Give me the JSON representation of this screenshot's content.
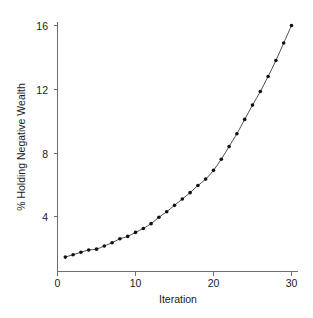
{
  "chart_data": {
    "type": "line",
    "title": "",
    "xlabel": "Iteration",
    "ylabel": "% Holding Negative Wealth",
    "xlim": [
      0,
      31
    ],
    "ylim": [
      0.8,
      16.6
    ],
    "xticks": [
      0,
      10,
      20,
      30
    ],
    "xtick_labels": [
      "0",
      "10",
      "20",
      "30"
    ],
    "yticks": [
      4,
      8,
      12,
      16
    ],
    "ytick_labels": [
      "4",
      "8",
      "12",
      "16"
    ],
    "grid": false,
    "legend": null,
    "marker": "filled-circle",
    "line_color": "#3a3a3a",
    "marker_color": "#111111",
    "axis_color": "#6e6e6e",
    "background_color": "#ffffff",
    "x": [
      1,
      2,
      3,
      4,
      5,
      6,
      7,
      8,
      9,
      10,
      11,
      12,
      13,
      14,
      15,
      16,
      17,
      18,
      19,
      20,
      21,
      22,
      23,
      24,
      25,
      26,
      27,
      28,
      29,
      30
    ],
    "values": [
      1.45,
      1.6,
      1.75,
      1.9,
      1.95,
      2.15,
      2.35,
      2.6,
      2.75,
      3.0,
      3.25,
      3.55,
      3.95,
      4.3,
      4.7,
      5.1,
      5.5,
      5.95,
      6.35,
      6.9,
      7.6,
      8.4,
      9.2,
      10.1,
      11.0,
      11.85,
      12.8,
      13.8,
      14.9,
      16.0
    ],
    "series": [
      {
        "name": "% Holding Negative Wealth",
        "values": [
          1.45,
          1.6,
          1.75,
          1.9,
          1.95,
          2.15,
          2.35,
          2.6,
          2.75,
          3.0,
          3.25,
          3.55,
          3.95,
          4.3,
          4.7,
          5.1,
          5.5,
          5.95,
          6.35,
          6.9,
          7.6,
          8.4,
          9.2,
          10.1,
          11.0,
          11.85,
          12.8,
          13.8,
          14.9,
          16.0
        ]
      }
    ]
  }
}
